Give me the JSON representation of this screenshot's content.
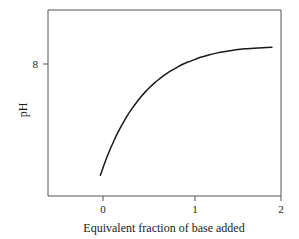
{
  "chart_data": {
    "type": "line",
    "title": "",
    "xlabel": "Equivalent fraction of base added",
    "ylabel": "pH",
    "xlim": [
      -0.58,
      2.0
    ],
    "ylim": [
      5.75,
      9.35
    ],
    "grid": false,
    "legend": null,
    "xticks": [
      0,
      1,
      2
    ],
    "xtick_labels": [
      "0",
      "1",
      "2"
    ],
    "yticks": [
      8
    ],
    "ytick_labels": [
      "8"
    ],
    "series": [
      {
        "name": "titration curve",
        "color": "#1a1a1a",
        "x": [
          0.0,
          0.05,
          0.1,
          0.15,
          0.2,
          0.25,
          0.3,
          0.35,
          0.4,
          0.45,
          0.5,
          0.55,
          0.6,
          0.65,
          0.7,
          0.75,
          0.8,
          0.85,
          0.9,
          0.95,
          1.0,
          1.1,
          1.2,
          1.3,
          1.4,
          1.5,
          1.6,
          1.7,
          1.8,
          1.9
        ],
        "y": [
          6.15,
          6.4,
          6.62,
          6.82,
          7.0,
          7.16,
          7.31,
          7.44,
          7.56,
          7.67,
          7.77,
          7.86,
          7.94,
          8.01,
          8.08,
          8.14,
          8.19,
          8.24,
          8.29,
          8.33,
          8.36,
          8.43,
          8.48,
          8.52,
          8.55,
          8.58,
          8.6,
          8.61,
          8.62,
          8.63
        ]
      }
    ]
  },
  "axes": {
    "x_axis_label": "Equivalent fraction of base added",
    "y_axis_label": "pH",
    "x_tick_0": "0",
    "x_tick_1": "1",
    "x_tick_2": "2",
    "y_tick_8": "8"
  }
}
